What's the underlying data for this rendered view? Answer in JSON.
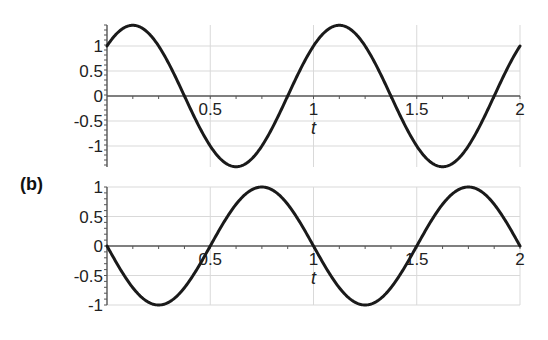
{
  "panel_label": "(b)",
  "chart_data": [
    {
      "type": "line",
      "title": "",
      "xlabel": "t",
      "ylabel": "",
      "function": "sin(2*pi*t) + cos(2*pi*t)",
      "xlim": [
        0,
        2
      ],
      "ylim": [
        -1.42,
        1.42
      ],
      "grid": true,
      "x_ticks": [
        "0.5",
        "1",
        "1.5",
        "2"
      ],
      "y_ticks": [
        "1",
        "0.5",
        "0",
        "-0.5",
        "-1"
      ],
      "series": [
        {
          "name": "top curve",
          "x": [
            0,
            0.125,
            0.25,
            0.375,
            0.5,
            0.625,
            0.75,
            0.875,
            1,
            1.125,
            1.25,
            1.375,
            1.5,
            1.625,
            1.75,
            1.875,
            2
          ],
          "values": [
            1,
            1.414,
            1,
            0,
            -1,
            -1.414,
            -1,
            0,
            1,
            1.414,
            1,
            0,
            -1,
            -1.414,
            -1,
            0,
            1
          ]
        }
      ],
      "layout": {
        "x0_px": 107,
        "px_per_t": 206.5,
        "y0_px": 96,
        "px_per_y": 50,
        "top_px": 25,
        "bottom_px": 167,
        "amp": 1.4142,
        "phase": 0.7854
      }
    },
    {
      "type": "line",
      "title": "",
      "xlabel": "t",
      "ylabel": "",
      "function": "-sin(2*pi*t)",
      "xlim": [
        0,
        2
      ],
      "ylim": [
        -1,
        1
      ],
      "grid": true,
      "x_ticks": [
        "0.5",
        "1",
        "1.5",
        "2"
      ],
      "y_ticks": [
        "1",
        "0.5",
        "0",
        "-0.5",
        "-1"
      ],
      "series": [
        {
          "name": "bottom curve",
          "x": [
            0,
            0.125,
            0.25,
            0.375,
            0.5,
            0.625,
            0.75,
            0.875,
            1,
            1.125,
            1.25,
            1.375,
            1.5,
            1.625,
            1.75,
            1.875,
            2
          ],
          "values": [
            0,
            -0.707,
            -1,
            -0.707,
            0,
            0.707,
            1,
            0.707,
            0,
            -0.707,
            -1,
            -0.707,
            0,
            0.707,
            1,
            0.707,
            0
          ]
        }
      ],
      "layout": {
        "x0_px": 107,
        "px_per_t": 206.5,
        "y0_px": 246,
        "px_per_y": 59,
        "top_px": 187,
        "bottom_px": 305,
        "amp": -1,
        "phase": 0
      }
    }
  ]
}
